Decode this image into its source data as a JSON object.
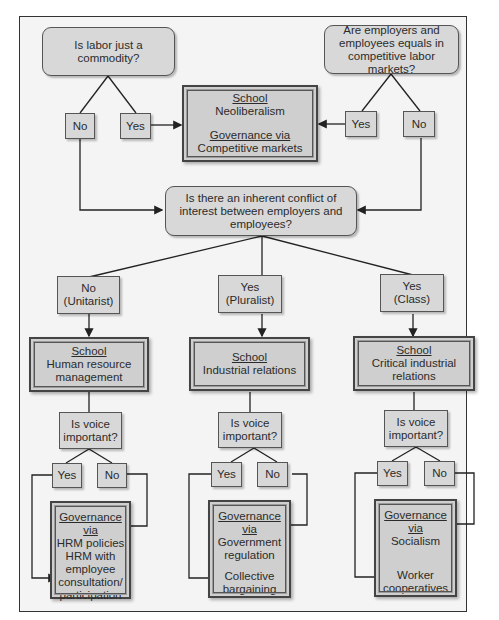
{
  "diagram": {
    "title_questions": {
      "q1": "Is labor just a commodity?",
      "q2": "Are employers and employees equals in competitive labor markets?",
      "q3": "Is there an inherent conflict of interest between employers and employees?"
    },
    "top_answers": {
      "q1_no": "No",
      "q1_yes": "Yes",
      "q2_yes": "Yes",
      "q2_no": "No"
    },
    "neoliberal_box": {
      "school_label": "School",
      "school": "Neoliberalism",
      "gov_label": "Governance via",
      "gov": "Competitive markets"
    },
    "branches": [
      {
        "answer_line1": "No",
        "answer_line2": "(Unitarist)",
        "school_label": "School",
        "school_line1": "Human resource",
        "school_line2": "management",
        "voice_q_line1": "Is voice",
        "voice_q_line2": "important?",
        "yes": "Yes",
        "no": "No",
        "gov_label": "Governance via",
        "gov_no_line1": "HRM policies",
        "gov_no_line2": "",
        "gov_yes_line1": "HRM with",
        "gov_yes_line2": "employee",
        "gov_yes_line3": "consultation/",
        "gov_yes_line4": "participation"
      },
      {
        "answer_line1": "Yes",
        "answer_line2": "(Pluralist)",
        "school_label": "School",
        "school_line1": "Industrial relations",
        "school_line2": "",
        "voice_q_line1": "Is voice",
        "voice_q_line2": "important?",
        "yes": "Yes",
        "no": "No",
        "gov_label": "Governance via",
        "gov_no_line1": "Government",
        "gov_no_line2": "regulation",
        "gov_yes_line1": "Collective",
        "gov_yes_line2": "bargaining",
        "gov_yes_line3": "",
        "gov_yes_line4": ""
      },
      {
        "answer_line1": "Yes",
        "answer_line2": "(Class)",
        "school_label": "School",
        "school_line1": "Critical industrial",
        "school_line2": "relations",
        "voice_q_line1": "Is voice",
        "voice_q_line2": "important?",
        "yes": "Yes",
        "no": "No",
        "gov_label": "Governance via",
        "gov_no_line1": "Socialism",
        "gov_no_line2": "",
        "gov_yes_line1": "Worker",
        "gov_yes_line2": "cooperatives",
        "gov_yes_line3": "",
        "gov_yes_line4": ""
      }
    ],
    "colors": {
      "box_fill": "#d8d8d8",
      "frame_fill": "#f4f4f4",
      "line": "#222222"
    }
  }
}
